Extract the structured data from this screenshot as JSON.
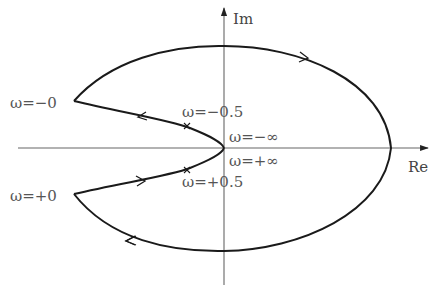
{
  "diagram": {
    "type": "nyquist-plot",
    "axes": {
      "real_label": "Re",
      "imag_label": "Im"
    },
    "labels": {
      "omega_minus_zero": "ω=−0",
      "omega_plus_zero": "ω=+0",
      "omega_minus_half": "ω=−0.5",
      "omega_plus_half": "ω=+0.5",
      "omega_minus_inf": "ω=−∞",
      "omega_plus_inf": "ω=+∞"
    },
    "colors": {
      "curve": "#1a1a1a",
      "axis": "#666666",
      "text": "#555555",
      "background": "#ffffff"
    }
  }
}
